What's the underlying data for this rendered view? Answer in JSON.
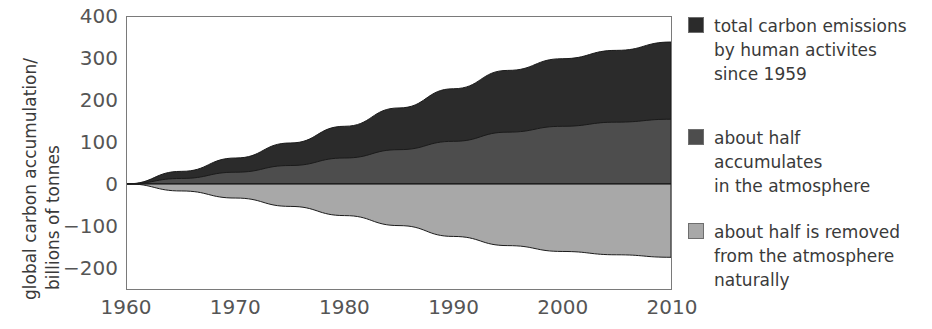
{
  "chart_data": {
    "type": "area",
    "title": "",
    "xlabel": "",
    "ylabel": "global carbon accumulation/ billions of tonnes",
    "ylabel_line1": "global carbon accumulation/",
    "ylabel_line2": "billions of tonnes",
    "xlim": [
      1960,
      2010
    ],
    "ylim": [
      -252,
      400
    ],
    "grid": false,
    "legend_position": "right",
    "x": [
      1960,
      1965,
      1970,
      1975,
      1980,
      1985,
      1990,
      1995,
      2000,
      2005,
      2010
    ],
    "y_ticks": [
      400,
      300,
      200,
      100,
      0,
      -100,
      -200
    ],
    "y_tick_labels": [
      "400",
      "300",
      "200",
      "100",
      "0",
      "−100",
      "−200"
    ],
    "x_ticks": [
      1960,
      1970,
      1980,
      1990,
      2000,
      2010
    ],
    "x_tick_labels": [
      "1960",
      "1970",
      "1980",
      "1990",
      "2000",
      "2010"
    ],
    "series": [
      {
        "name": "total carbon emissions by human activites since 1959",
        "color": "#2b2b2b",
        "values": [
          0,
          30,
          62,
          98,
          138,
          182,
          228,
          272,
          300,
          320,
          340
        ]
      },
      {
        "name": "about half accumulates in the atmosphere",
        "color": "#4d4d4d",
        "values": [
          0,
          13,
          28,
          44,
          62,
          82,
          102,
          124,
          138,
          148,
          155
        ]
      },
      {
        "name": "about half is removed from the atmosphere naturally",
        "color": "#a8a8a8",
        "values": [
          0,
          -17,
          -34,
          -54,
          -76,
          -100,
          -126,
          -148,
          -162,
          -170,
          -176
        ]
      }
    ]
  },
  "legend": {
    "entries": [
      {
        "label": "total carbon emissions\nby human activites\nsince 1959",
        "color": "#2b2b2b"
      },
      {
        "label": "about half\naccumulates\nin the atmosphere",
        "color": "#4d4d4d"
      },
      {
        "label": "about half is removed\nfrom the atmosphere\nnaturally",
        "color": "#a8a8a8"
      }
    ]
  }
}
